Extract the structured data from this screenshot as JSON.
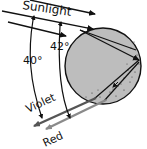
{
  "diagram": {
    "labels": {
      "sunlight": "Sunlight",
      "angle_red": "42°",
      "angle_violet": "40°",
      "violet": "Violet",
      "red": "Red"
    },
    "colors": {
      "drop_fill": "#bdbdbd",
      "drop_stroke": "#111111",
      "ray": "#111111",
      "violet_ray": "#555555",
      "red_ray": "#8a8a8a",
      "background": "#ffffff"
    },
    "elements": [
      {
        "id": "raindrop",
        "type": "circle",
        "label": "raindrop"
      },
      {
        "id": "sunlight-ray-1",
        "type": "arrow",
        "label": "incoming sunlight"
      },
      {
        "id": "sunlight-ray-2",
        "type": "arrow",
        "label": "incoming sunlight"
      },
      {
        "id": "violet-ray",
        "type": "arrow",
        "label": "Violet"
      },
      {
        "id": "red-ray",
        "type": "arrow",
        "label": "Red"
      },
      {
        "id": "angle-40",
        "type": "arc",
        "label": "40°"
      },
      {
        "id": "angle-42",
        "type": "arc",
        "label": "42°"
      }
    ]
  }
}
